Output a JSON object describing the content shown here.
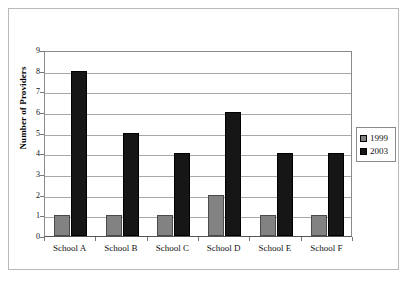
{
  "chart_data": {
    "type": "bar",
    "title": "",
    "xlabel": "",
    "ylabel": "Number of Providers",
    "categories": [
      "School A",
      "School B",
      "School C",
      "School D",
      "School E",
      "School F"
    ],
    "series": [
      {
        "name": "1999",
        "color": "#828282",
        "values": [
          1,
          1,
          1,
          2,
          1,
          1
        ]
      },
      {
        "name": "2003",
        "color": "#161616",
        "values": [
          8,
          5,
          4,
          6,
          4,
          4
        ]
      }
    ],
    "ylim": [
      0,
      9
    ],
    "yticks": [
      0,
      1,
      2,
      3,
      4,
      5,
      6,
      7,
      8,
      9
    ],
    "ytick_labels": [
      "0",
      "1",
      "2",
      "3",
      "4",
      "5",
      "6",
      "7",
      "8",
      "9"
    ],
    "grid": "horizontal",
    "legend_position": "right"
  },
  "legend": {
    "items": [
      {
        "label": "1999"
      },
      {
        "label": "2003"
      }
    ]
  }
}
